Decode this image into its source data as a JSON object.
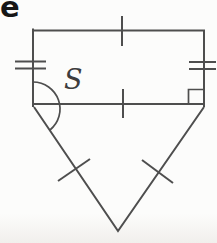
{
  "figure": {
    "problem_label": "e",
    "angle_label": "S",
    "marks": {
      "top_side_ticks": 1,
      "bottom_chord_ticks": 1,
      "left_side_ticks": 2,
      "right_side_ticks": 2,
      "triangle_left_side_ticks": 1,
      "triangle_right_side_ticks": 1,
      "right_angle_marker": true,
      "angle_arc_vertex": "bottom-left"
    },
    "colors": {
      "line": "#4e4e4e",
      "background": "#fcfcfb",
      "label": "#161616"
    }
  }
}
